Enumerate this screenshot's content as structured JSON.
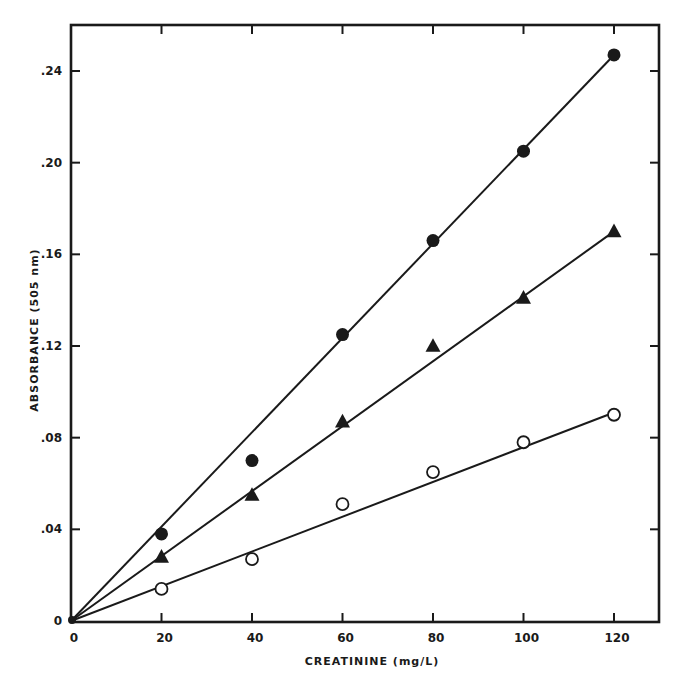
{
  "chart_data": {
    "type": "scatter",
    "title": "",
    "xlabel": "CREATININE (mg/L)",
    "ylabel": "ABSORBANCE (505 nm)",
    "xlim": [
      0,
      130
    ],
    "ylim": [
      0,
      0.26
    ],
    "x_ticks": [
      0,
      20,
      40,
      60,
      80,
      100,
      120
    ],
    "x_tick_labels": [
      "0",
      "20",
      "40",
      "60",
      "80",
      "100",
      "120"
    ],
    "y_ticks": [
      0,
      0.04,
      0.08,
      0.12,
      0.16,
      0.2,
      0.24
    ],
    "y_tick_labels": [
      "0",
      ".04",
      ".08",
      ".12",
      ".16",
      ".20",
      ".24"
    ],
    "grid": false,
    "legend": null,
    "series": [
      {
        "name": "filled-circles",
        "marker": "filled-circle",
        "x": [
          20,
          40,
          60,
          80,
          100,
          120
        ],
        "values": [
          0.038,
          0.07,
          0.125,
          0.166,
          0.205,
          0.247
        ],
        "fit_line": {
          "x": [
            0,
            120
          ],
          "y": [
            0,
            0.247
          ]
        }
      },
      {
        "name": "filled-triangles",
        "marker": "filled-triangle",
        "x": [
          20,
          40,
          60,
          80,
          100,
          120
        ],
        "values": [
          0.028,
          0.055,
          0.087,
          0.12,
          0.141,
          0.17
        ],
        "fit_line": {
          "x": [
            0,
            120
          ],
          "y": [
            0,
            0.17
          ]
        }
      },
      {
        "name": "open-circles",
        "marker": "open-circle",
        "x": [
          20,
          40,
          60,
          80,
          100,
          120
        ],
        "values": [
          0.014,
          0.027,
          0.051,
          0.065,
          0.078,
          0.09
        ],
        "fit_line": {
          "x": [
            0,
            120
          ],
          "y": [
            0,
            0.091
          ]
        }
      }
    ]
  },
  "colors": {
    "ink": "#1a1a1a",
    "background": "#ffffff"
  }
}
